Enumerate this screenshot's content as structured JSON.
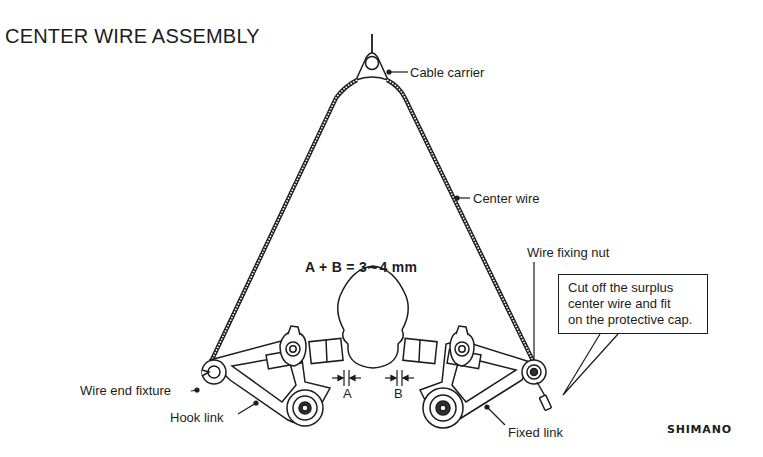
{
  "title": "CENTER WIRE ASSEMBLY",
  "formula": "A + B = 3∼4 mm",
  "labels": {
    "cable_carrier": "Cable carrier",
    "center_wire": "Center wire",
    "wire_fixing_nut": "Wire fixing nut",
    "wire_end_fixture": "Wire end fixture",
    "hook_link": "Hook link",
    "fixed_link": "Fixed link",
    "gap_a": "A",
    "gap_b": "B"
  },
  "callout": {
    "lines": [
      "Cut off the surplus",
      "center wire and fit",
      "on the protective cap."
    ]
  },
  "brand": "SHIMANO",
  "colors": {
    "ink": "#1c1c1c",
    "background": "#ffffff"
  }
}
